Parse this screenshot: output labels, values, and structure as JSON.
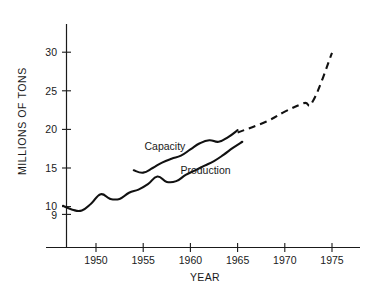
{
  "chart_data": {
    "type": "line",
    "title": "",
    "xlabel": "YEAR",
    "ylabel": "MILLIONS OF TONS",
    "xlim": [
      1946,
      1977
    ],
    "ylim": [
      8.6,
      31.5
    ],
    "grid": false,
    "legend_position": "inline-annotation",
    "x_ticks": [
      1950,
      1955,
      1960,
      1965,
      1970,
      1975
    ],
    "x_tick_labels": [
      "1950",
      "1955",
      "1960",
      "1965",
      "1970",
      "1975"
    ],
    "y_ticks": [
      9,
      10,
      15,
      20,
      25,
      30
    ],
    "y_tick_labels": [
      "9",
      "10",
      "15",
      "20",
      "25",
      "30"
    ],
    "series": [
      {
        "name": "Capacity",
        "style": "solid",
        "x": [
          1954.0,
          1955.0,
          1956.0,
          1957.0,
          1958.0,
          1959.0,
          1960.0,
          1961.0,
          1962.0,
          1963.0,
          1964.0,
          1965.0
        ],
        "values": [
          14.7,
          14.4,
          15.0,
          15.7,
          16.2,
          16.6,
          17.4,
          18.2,
          18.6,
          18.4,
          19.0,
          19.9
        ]
      },
      {
        "name": "Capacity projection",
        "style": "dashed",
        "x": [
          1965.0,
          1968.0,
          1970.0,
          1972.0,
          1973.0,
          1975.0
        ],
        "values": [
          19.6,
          21.0,
          22.3,
          23.4,
          23.7,
          29.9
        ]
      },
      {
        "name": "Production",
        "style": "solid",
        "x": [
          1946.5,
          1947.5,
          1948.5,
          1949.5,
          1950.5,
          1951.5,
          1952.5,
          1953.5,
          1954.5,
          1955.5,
          1956.5,
          1957.5,
          1958.5,
          1959.5,
          1960.5,
          1961.5,
          1962.5,
          1963.5,
          1964.5,
          1965.5
        ],
        "values": [
          10.1,
          9.6,
          9.5,
          10.4,
          11.6,
          11.0,
          11.0,
          11.8,
          12.2,
          12.9,
          13.9,
          13.2,
          13.3,
          14.1,
          14.7,
          15.3,
          15.9,
          16.7,
          17.6,
          18.4
        ]
      }
    ],
    "annotations": [
      {
        "text": "Capacity",
        "x": 1957.3,
        "y": 17.3
      },
      {
        "text": "Production",
        "x": 1961.6,
        "y": 14.2
      }
    ]
  },
  "colors": {
    "axis": "#1a1a1a",
    "line": "#111111",
    "background": "#ffffff"
  }
}
